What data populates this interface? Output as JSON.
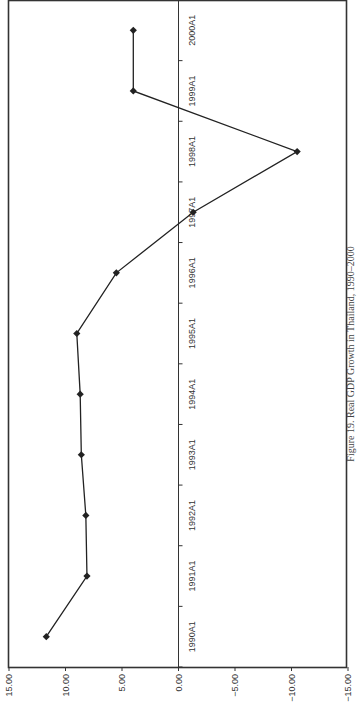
{
  "chart_data": {
    "type": "line",
    "orientation": "rotated-90-clockwise",
    "title": "Figure 19. Real GDP Growth in Thailand, 1990–2000",
    "xlabel": "",
    "ylabel": "",
    "categories": [
      "1990A1",
      "1991A1",
      "1992A1",
      "1993A1",
      "1994A1",
      "1995A1",
      "1996A1",
      "1997A1",
      "1998A1",
      "1999A1",
      "2000A1"
    ],
    "series": [
      {
        "name": "Real GDP Growth",
        "values": [
          11.7,
          8.1,
          8.2,
          8.6,
          8.7,
          9.0,
          5.5,
          -1.3,
          -10.5,
          4.0,
          4.0
        ],
        "color": "#222222",
        "marker": "diamond"
      }
    ],
    "ylim": [
      -15,
      15
    ],
    "yticks": [
      "15.00",
      "10.00",
      "5.00",
      "0.00",
      "-5.00",
      "-10.00",
      "-15.00"
    ],
    "grid": false,
    "legend": "none"
  }
}
